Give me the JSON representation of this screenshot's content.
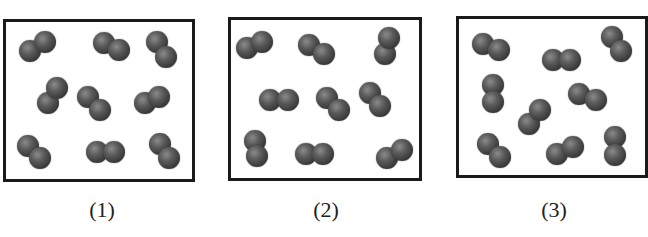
{
  "panels": [
    {
      "label": "(1)",
      "box": {
        "left": 3,
        "top": 19,
        "width": 192,
        "height": 163
      },
      "label_pos": {
        "left": 72,
        "top": 197
      },
      "molecules": [
        [
          [
            30,
            51
          ],
          [
            45,
            42
          ]
        ],
        [
          [
            104,
            43
          ],
          [
            119,
            50
          ]
        ],
        [
          [
            157,
            42
          ],
          [
            166,
            57
          ]
        ],
        [
          [
            48,
            103
          ],
          [
            57,
            88
          ]
        ],
        [
          [
            88,
            97
          ],
          [
            100,
            110
          ]
        ],
        [
          [
            145,
            103
          ],
          [
            159,
            97
          ]
        ],
        [
          [
            28,
            146
          ],
          [
            40,
            158
          ]
        ],
        [
          [
            97,
            152
          ],
          [
            114,
            152
          ]
        ],
        [
          [
            160,
            144
          ],
          [
            169,
            158
          ]
        ]
      ]
    },
    {
      "label": "(2)",
      "box": {
        "left": 228,
        "top": 17,
        "width": 194,
        "height": 164
      },
      "label_pos": {
        "left": 296,
        "top": 197
      },
      "molecules": [
        [
          [
            247,
            48
          ],
          [
            262,
            42
          ]
        ],
        [
          [
            309,
            45
          ],
          [
            324,
            54
          ]
        ],
        [
          [
            385,
            54
          ],
          [
            389,
            38
          ]
        ],
        [
          [
            270,
            100
          ],
          [
            288,
            100
          ]
        ],
        [
          [
            327,
            98
          ],
          [
            339,
            110
          ]
        ],
        [
          [
            370,
            93
          ],
          [
            380,
            106
          ]
        ],
        [
          [
            255,
            141
          ],
          [
            257,
            156
          ]
        ],
        [
          [
            306,
            154
          ],
          [
            323,
            154
          ]
        ],
        [
          [
            387,
            158
          ],
          [
            402,
            150
          ]
        ]
      ]
    },
    {
      "label": "(3)",
      "box": {
        "left": 456,
        "top": 16,
        "width": 192,
        "height": 162
      },
      "label_pos": {
        "left": 524,
        "top": 197
      },
      "molecules": [
        [
          [
            483,
            44
          ],
          [
            499,
            50
          ]
        ],
        [
          [
            553,
            60
          ],
          [
            570,
            60
          ]
        ],
        [
          [
            612,
            37
          ],
          [
            621,
            51
          ]
        ],
        [
          [
            493,
            85
          ],
          [
            493,
            102
          ]
        ],
        [
          [
            529,
            124
          ],
          [
            540,
            110
          ]
        ],
        [
          [
            579,
            94
          ],
          [
            596,
            100
          ]
        ],
        [
          [
            488,
            144
          ],
          [
            500,
            157
          ]
        ],
        [
          [
            557,
            154
          ],
          [
            573,
            147
          ]
        ],
        [
          [
            615,
            137
          ],
          [
            615,
            155
          ]
        ]
      ]
    }
  ]
}
